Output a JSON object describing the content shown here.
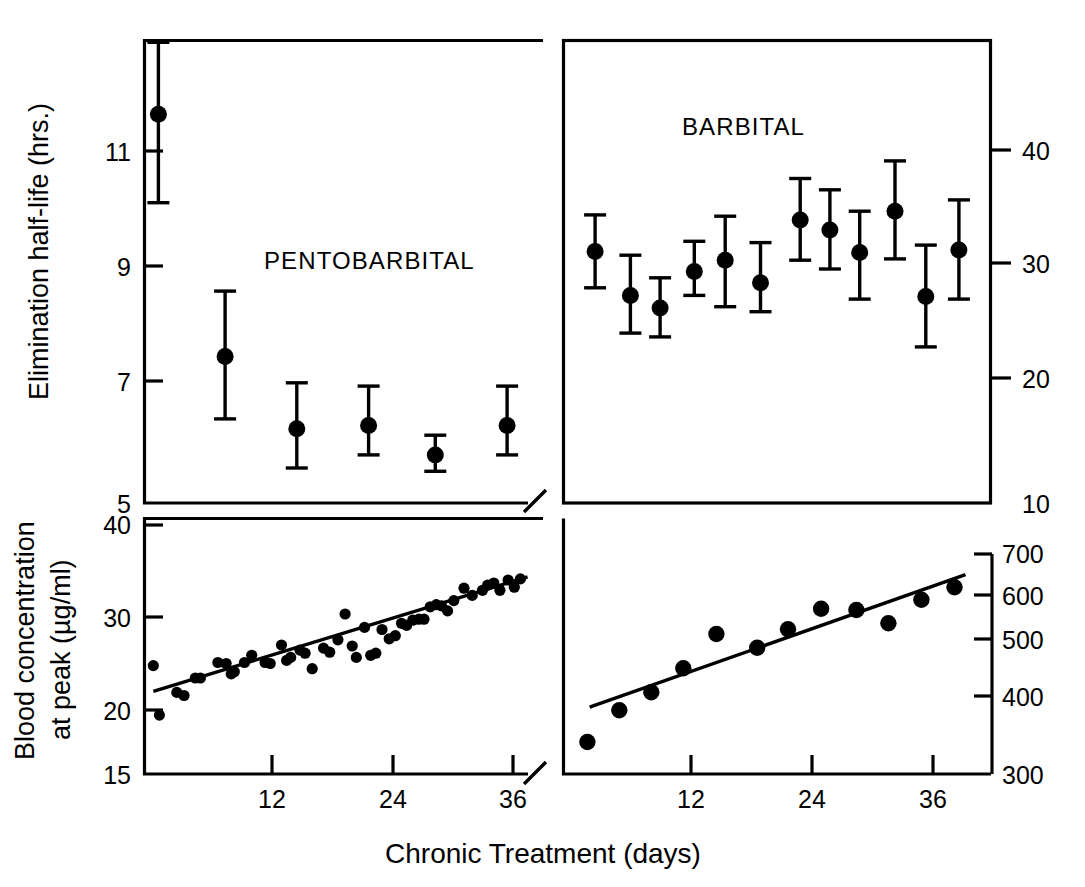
{
  "figure": {
    "xaxis_title": "Chronic Treatment  (days)",
    "x_ticks": [
      "12",
      "24",
      "36"
    ]
  },
  "panels": {
    "top_left": {
      "title": "PENTOBARBITAL",
      "y_axis_title": "Elimination half-life (hrs.)",
      "y_ticks": [
        "11",
        "9",
        "7",
        "5"
      ]
    },
    "top_right": {
      "title": "BARBITAL",
      "y_ticks": [
        "40",
        "30",
        "20",
        "10"
      ]
    },
    "bottom_left": {
      "y_axis_title_line1": "Blood concentration",
      "y_axis_title_line2": "at peak (µg/ml)",
      "y_ticks": [
        "40",
        "30",
        "20",
        "15"
      ]
    },
    "bottom_right": {
      "y_ticks": [
        "700",
        "600",
        "500",
        "400",
        "300"
      ]
    }
  },
  "chart_data": [
    {
      "id": "pentobarbital-half-life",
      "type": "scatter",
      "title": "PENTOBARBITAL",
      "xlabel": "Chronic Treatment  (days)",
      "ylabel": "Elimination half-life (hrs.)",
      "grid": false,
      "legend": "none",
      "xlim": [
        0,
        39
      ],
      "ylim": [
        5,
        12.1
      ],
      "xtick_values": [
        12,
        24,
        36
      ],
      "ytick_values": [
        11,
        9,
        7,
        5
      ],
      "errorbars": [
        {
          "x": 1.5,
          "y": 10.95,
          "low": 9.6,
          "high": 12.05
        },
        {
          "x": 8.0,
          "y": 7.25,
          "low": 6.3,
          "high": 8.25
        },
        {
          "x": 15.0,
          "y": 6.15,
          "low": 5.55,
          "high": 6.85
        },
        {
          "x": 22.0,
          "y": 6.2,
          "low": 5.75,
          "high": 6.8
        },
        {
          "x": 28.5,
          "y": 5.75,
          "low": 5.5,
          "high": 6.05
        },
        {
          "x": 35.5,
          "y": 6.2,
          "low": 5.75,
          "high": 6.8
        }
      ]
    },
    {
      "id": "barbital-half-life",
      "type": "scatter",
      "title": "BARBITAL",
      "xlabel": "Chronic Treatment  (days)",
      "ylabel": "Elimination half-life (hrs.)",
      "grid": false,
      "legend": "none",
      "xlim": [
        0,
        39
      ],
      "ylim": [
        10,
        47
      ],
      "xtick_values": [
        12,
        24,
        36
      ],
      "ytick_values": [
        40,
        30,
        20,
        10
      ],
      "errorbars": [
        {
          "x": 3.0,
          "y": 30.1,
          "low": 27.2,
          "high": 33.0
        },
        {
          "x": 6.2,
          "y": 26.6,
          "low": 23.6,
          "high": 29.8
        },
        {
          "x": 8.9,
          "y": 25.6,
          "low": 23.3,
          "high": 28.0
        },
        {
          "x": 12.0,
          "y": 28.5,
          "low": 26.6,
          "high": 30.9
        },
        {
          "x": 14.8,
          "y": 29.4,
          "low": 25.7,
          "high": 32.9
        },
        {
          "x": 18.0,
          "y": 27.6,
          "low": 25.3,
          "high": 30.8
        },
        {
          "x": 21.6,
          "y": 32.6,
          "low": 29.4,
          "high": 35.9
        },
        {
          "x": 24.3,
          "y": 31.8,
          "low": 28.7,
          "high": 35.0
        },
        {
          "x": 27.0,
          "y": 30.0,
          "low": 26.3,
          "high": 33.3
        },
        {
          "x": 30.2,
          "y": 33.3,
          "low": 29.5,
          "high": 37.3
        },
        {
          "x": 33.0,
          "y": 26.5,
          "low": 22.5,
          "high": 30.6
        },
        {
          "x": 36.0,
          "y": 30.2,
          "low": 26.3,
          "high": 34.2
        }
      ]
    },
    {
      "id": "pentobarbital-blood-concentration",
      "type": "scatter",
      "title": "",
      "xlabel": "Chronic Treatment  (days)",
      "ylabel": "Blood concentration at peak (µg/ml)",
      "grid": false,
      "legend": "none",
      "xlim": [
        0,
        39
      ],
      "ylim": [
        15,
        40
      ],
      "xtick_values": [
        12,
        24,
        36
      ],
      "ytick_values": [
        40,
        30,
        20,
        15
      ],
      "points": [
        {
          "x": 1.0,
          "y": 25.6
        },
        {
          "x": 1.6,
          "y": 20.8
        },
        {
          "x": 3.3,
          "y": 23.0
        },
        {
          "x": 4.0,
          "y": 22.7
        },
        {
          "x": 5.1,
          "y": 24.4
        },
        {
          "x": 5.6,
          "y": 24.4
        },
        {
          "x": 7.3,
          "y": 25.9
        },
        {
          "x": 8.1,
          "y": 25.8
        },
        {
          "x": 8.6,
          "y": 24.8
        },
        {
          "x": 8.9,
          "y": 25.0
        },
        {
          "x": 9.9,
          "y": 25.9
        },
        {
          "x": 10.6,
          "y": 26.6
        },
        {
          "x": 11.9,
          "y": 25.9
        },
        {
          "x": 12.4,
          "y": 25.8
        },
        {
          "x": 13.5,
          "y": 27.6
        },
        {
          "x": 14.0,
          "y": 26.1
        },
        {
          "x": 14.4,
          "y": 26.4
        },
        {
          "x": 15.3,
          "y": 27.1
        },
        {
          "x": 15.8,
          "y": 26.8
        },
        {
          "x": 16.5,
          "y": 25.3
        },
        {
          "x": 17.6,
          "y": 27.3
        },
        {
          "x": 18.2,
          "y": 26.9
        },
        {
          "x": 19.0,
          "y": 28.1
        },
        {
          "x": 19.7,
          "y": 30.6
        },
        {
          "x": 20.4,
          "y": 27.5
        },
        {
          "x": 20.8,
          "y": 26.4
        },
        {
          "x": 21.6,
          "y": 29.3
        },
        {
          "x": 22.2,
          "y": 26.6
        },
        {
          "x": 22.7,
          "y": 26.8
        },
        {
          "x": 23.3,
          "y": 29.1
        },
        {
          "x": 24.0,
          "y": 28.2
        },
        {
          "x": 24.6,
          "y": 28.5
        },
        {
          "x": 25.2,
          "y": 29.7
        },
        {
          "x": 25.7,
          "y": 29.5
        },
        {
          "x": 26.3,
          "y": 30.0
        },
        {
          "x": 26.9,
          "y": 30.1
        },
        {
          "x": 27.4,
          "y": 30.1
        },
        {
          "x": 28.0,
          "y": 31.3
        },
        {
          "x": 28.6,
          "y": 31.5
        },
        {
          "x": 29.1,
          "y": 31.4
        },
        {
          "x": 29.7,
          "y": 30.9
        },
        {
          "x": 30.3,
          "y": 31.9
        },
        {
          "x": 31.3,
          "y": 33.1
        },
        {
          "x": 32.1,
          "y": 32.4
        },
        {
          "x": 33.1,
          "y": 32.9
        },
        {
          "x": 33.6,
          "y": 33.4
        },
        {
          "x": 34.2,
          "y": 33.6
        },
        {
          "x": 34.8,
          "y": 32.9
        },
        {
          "x": 35.6,
          "y": 33.9
        },
        {
          "x": 36.2,
          "y": 33.2
        },
        {
          "x": 36.8,
          "y": 34.0
        }
      ],
      "fit_line": {
        "x1": 1.0,
        "y1": 23.1,
        "x2": 37.5,
        "y2": 34.2
      }
    },
    {
      "id": "barbital-blood-concentration",
      "type": "scatter",
      "title": "",
      "xlabel": "Chronic Treatment  (days)",
      "ylabel": "Blood concentration at peak (µg/ml)",
      "grid": false,
      "legend": "none",
      "xlim": [
        0,
        39
      ],
      "ylim": [
        300,
        730
      ],
      "xtick_values": [
        12,
        24,
        36
      ],
      "ytick_values": [
        700,
        600,
        500,
        400,
        300
      ],
      "points": [
        {
          "x": 2.3,
          "y": 355
        },
        {
          "x": 5.2,
          "y": 408
        },
        {
          "x": 8.1,
          "y": 438
        },
        {
          "x": 11.0,
          "y": 478
        },
        {
          "x": 14.0,
          "y": 535
        },
        {
          "x": 17.7,
          "y": 512
        },
        {
          "x": 20.5,
          "y": 543
        },
        {
          "x": 23.5,
          "y": 577
        },
        {
          "x": 26.7,
          "y": 575
        },
        {
          "x": 29.6,
          "y": 553
        },
        {
          "x": 32.6,
          "y": 592
        },
        {
          "x": 35.6,
          "y": 613
        }
      ],
      "fit_line": {
        "x1": 2.5,
        "y1": 413,
        "x2": 36.6,
        "y2": 634
      }
    }
  ]
}
